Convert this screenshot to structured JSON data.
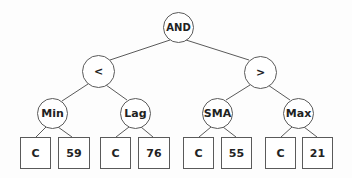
{
  "diagram": {
    "type": "expression-tree",
    "root": {
      "id": "and",
      "label": "AND",
      "shape": "circle",
      "cx": 178,
      "cy": 27,
      "r": 15,
      "children": [
        "lt",
        "gt"
      ]
    },
    "operators": [
      {
        "id": "lt",
        "label": "<",
        "shape": "circle",
        "cx": 98,
        "cy": 71,
        "r": 16,
        "children": [
          "min",
          "lag"
        ]
      },
      {
        "id": "gt",
        "label": ">",
        "shape": "circle",
        "cx": 260,
        "cy": 72,
        "r": 16,
        "children": [
          "sma",
          "max"
        ]
      }
    ],
    "functions": [
      {
        "id": "min",
        "label": "Min",
        "shape": "circle",
        "cx": 52,
        "cy": 113,
        "r": 15,
        "children": [
          "min_c",
          "min_v"
        ]
      },
      {
        "id": "lag",
        "label": "Lag",
        "shape": "circle",
        "cx": 135,
        "cy": 113,
        "r": 15,
        "children": [
          "lag_c",
          "lag_v"
        ]
      },
      {
        "id": "sma",
        "label": "SMA",
        "shape": "circle",
        "cx": 217,
        "cy": 113,
        "r": 15,
        "children": [
          "sma_c",
          "sma_v"
        ]
      },
      {
        "id": "max",
        "label": "Max",
        "shape": "circle",
        "cx": 298,
        "cy": 113,
        "r": 15,
        "children": [
          "max_c",
          "max_v"
        ]
      }
    ],
    "leaves": [
      {
        "id": "min_c",
        "label": "C",
        "shape": "box",
        "x": 20,
        "y": 137,
        "w": 31,
        "h": 32
      },
      {
        "id": "min_v",
        "label": "59",
        "shape": "box",
        "x": 58,
        "y": 137,
        "w": 32,
        "h": 32
      },
      {
        "id": "lag_c",
        "label": "C",
        "shape": "box",
        "x": 100,
        "y": 137,
        "w": 31,
        "h": 32
      },
      {
        "id": "lag_v",
        "label": "76",
        "shape": "box",
        "x": 138,
        "y": 137,
        "w": 32,
        "h": 32
      },
      {
        "id": "sma_c",
        "label": "C",
        "shape": "box",
        "x": 183,
        "y": 137,
        "w": 31,
        "h": 32
      },
      {
        "id": "sma_v",
        "label": "55",
        "shape": "box",
        "x": 221,
        "y": 137,
        "w": 31,
        "h": 32
      },
      {
        "id": "max_c",
        "label": "C",
        "shape": "box",
        "x": 265,
        "y": 137,
        "w": 31,
        "h": 32
      },
      {
        "id": "max_v",
        "label": "21",
        "shape": "box",
        "x": 302,
        "y": 137,
        "w": 31,
        "h": 32
      }
    ],
    "colors": {
      "stroke": "#5a5a5a",
      "text": "#222222",
      "background": "#fdfdfd"
    }
  }
}
